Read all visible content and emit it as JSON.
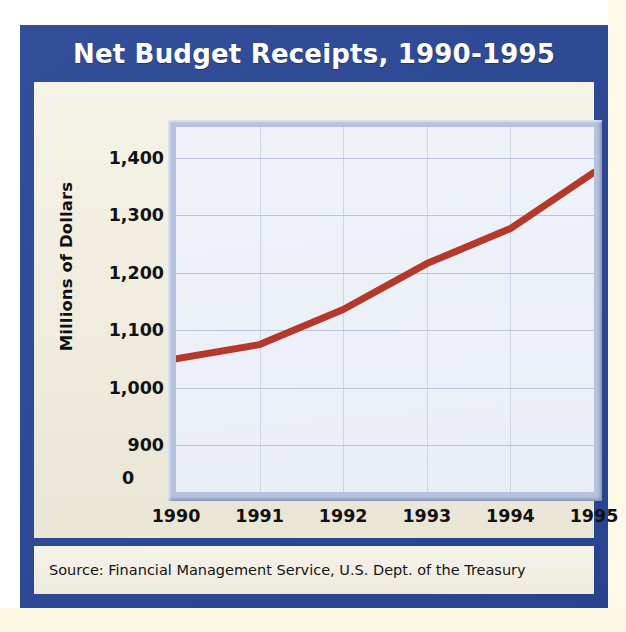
{
  "title": "Net Budget Receipts, 1990-1995",
  "source": "Source: Financial Management Service, U.S. Dept. of the Treasury",
  "colors": {
    "frame_blue": "#2a4795",
    "panel_cream": "#f2efe3",
    "plot_bg": "#eef1f8",
    "plot_border": "#b6c2de",
    "line_red": "#b5392b",
    "gridline": "#b9c4da",
    "title_text": "#ffffff",
    "body_text": "#111111"
  },
  "chart_data": {
    "type": "line",
    "title": "Net Budget Receipts, 1990-1995",
    "xlabel": "",
    "ylabel": "Millions of Dollars",
    "categories": [
      "1990",
      "1991",
      "1992",
      "1993",
      "1994",
      "1995"
    ],
    "x": [
      1990,
      1991,
      1992,
      1993,
      1994,
      1995
    ],
    "values": [
      1050,
      1075,
      1136,
      1216,
      1277,
      1375
    ],
    "series": [
      {
        "name": "Net Budget Receipts",
        "color": "#b5392b",
        "values": [
          1050,
          1075,
          1136,
          1216,
          1277,
          1375
        ]
      }
    ],
    "ytick_labels": [
      "1,400",
      "1,300",
      "1,200",
      "1,100",
      "1,000",
      "900",
      "0"
    ],
    "ytick_values": [
      1400,
      1300,
      1200,
      1100,
      1000,
      900,
      0
    ],
    "xtick_labels": [
      "1990",
      "1991",
      "1992",
      "1993",
      "1994",
      "1995"
    ],
    "ylim": [
      855,
      1450
    ],
    "xlim": [
      1990,
      1995
    ],
    "axis_break": true,
    "grid": true,
    "legend": false,
    "legend_position": "none",
    "source_note": "Source: Financial Management Service, U.S. Dept. of the Treasury"
  }
}
